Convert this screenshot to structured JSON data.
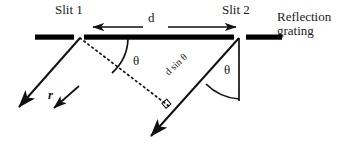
{
  "figure": {
    "background_color": "#ffffff",
    "ink_color": "#000000"
  },
  "labels": {
    "slit1": "Slit 1",
    "slit2": "Slit 2",
    "grating_line1": "Reflection",
    "grating_line2": "grating",
    "separation": "d",
    "theta_left": "θ",
    "theta_right": "θ",
    "incident_ray": "r",
    "path_difference": "d sin θ"
  },
  "geometry": {
    "slit1": {
      "x": 80,
      "y": 38
    },
    "slit2": {
      "x": 239,
      "y": 38
    },
    "grating_bar_left": {
      "x1": 35,
      "x2": 74,
      "y": 37
    },
    "grating_bar_middle": {
      "x1": 85,
      "x2": 234,
      "y": 37
    },
    "grating_bar_right": {
      "x1": 246,
      "x2": 282,
      "y": 37
    },
    "d_arrow_left": {
      "from_x": 143,
      "to_x": 91,
      "y": 27
    },
    "d_arrow_right": {
      "from_x": 168,
      "to_x": 238,
      "y": 27
    },
    "ray_slit1_out": {
      "x1": 80,
      "y1": 38,
      "x2": 16,
      "y2": 110
    },
    "ray_slit2_out": {
      "x1": 239,
      "y1": 38,
      "x2": 148,
      "y2": 139
    },
    "dotted_wavefront": {
      "x1": 80,
      "y1": 38,
      "x2": 170,
      "y2": 107
    },
    "vertical_normal": {
      "x": 239,
      "y1": 38,
      "y2": 101
    },
    "right_angle_marker": {
      "x": 167,
      "y": 104
    },
    "r_arrow": {
      "x1": 78,
      "y1": 87,
      "x2": 51,
      "y2": 111
    }
  }
}
